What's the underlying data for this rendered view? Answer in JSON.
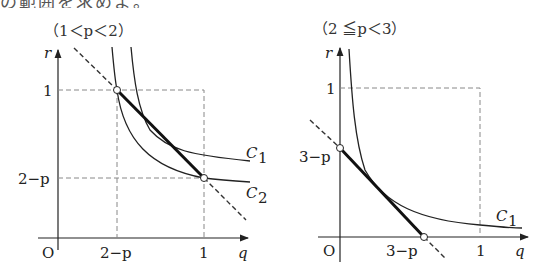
{
  "header": {
    "text": "の範囲を求めよ。"
  },
  "left_graph": {
    "title": "（1＜p＜2）",
    "axis_y_label": "r",
    "axis_x_label": "q",
    "origin_label": "O",
    "y_ticks": [
      "1",
      "2−p"
    ],
    "x_ticks": [
      "2−p",
      "1"
    ],
    "curve_labels": [
      "C",
      "C"
    ],
    "curve_subscripts": [
      "1",
      "2"
    ]
  },
  "right_graph": {
    "title": "（2 ≦p＜3）",
    "axis_y_label": "r",
    "axis_x_label": "q",
    "origin_label": "O",
    "y_ticks": [
      "1",
      "3−p"
    ],
    "x_ticks": [
      "3−p",
      "1"
    ],
    "curve_labels": [
      "C"
    ],
    "curve_subscripts": [
      "1"
    ]
  },
  "colors": {
    "line": "#222222",
    "dashed": "#888888",
    "thick": "#111111"
  }
}
